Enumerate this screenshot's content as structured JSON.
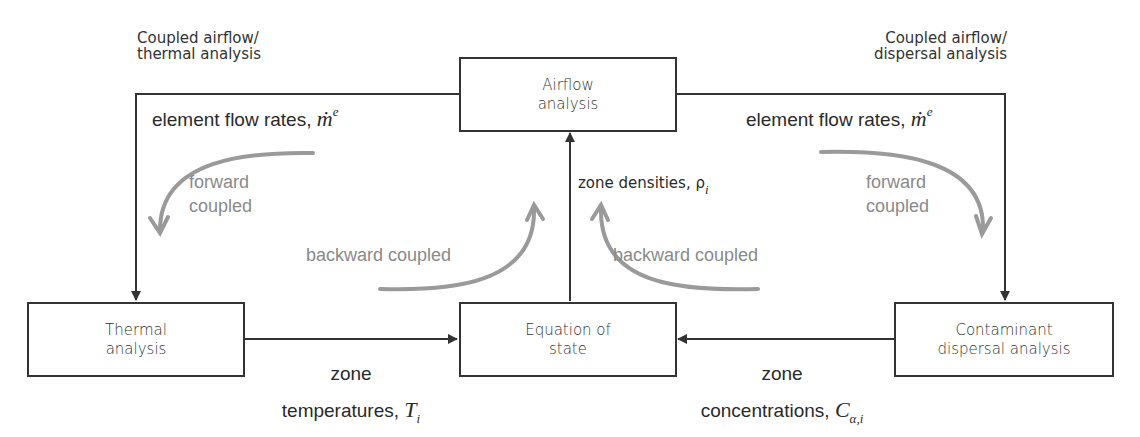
{
  "captions": {
    "left": {
      "line1": "Coupled airflow/",
      "line2": "thermal analysis"
    },
    "right": {
      "line1": "Coupled airflow/",
      "line2": "dispersal analysis"
    }
  },
  "boxes": {
    "airflow": {
      "line1": "Airflow",
      "line2": "analysis"
    },
    "thermal": {
      "line1": "Thermal",
      "line2": "analysis"
    },
    "equation": {
      "line1": "Equation of",
      "line2": "state"
    },
    "contaminant": {
      "line1": "Contaminant",
      "line2": "dispersal analysis"
    }
  },
  "flows": {
    "left_flow_rates": {
      "text": "element flow rates, ",
      "symbol": "ṁ",
      "sup": "e"
    },
    "right_flow_rates": {
      "text": "element flow rates, ",
      "symbol": "ṁ",
      "sup": "e"
    },
    "densities": {
      "text": "zone densities, ",
      "symbol": "ρ",
      "sub": "i"
    },
    "temperatures": {
      "line1": "zone",
      "line2": "temperatures, ",
      "symbol": "T",
      "sub": "i"
    },
    "concentrations": {
      "line1": "zone",
      "line2": "concentrations, ",
      "symbol": "C",
      "sub": "α,i"
    }
  },
  "coupling_labels": {
    "forward_left": {
      "line1": "forward",
      "line2": "coupled"
    },
    "forward_right": {
      "line1": "forward",
      "line2": "coupled"
    },
    "backward_left": "backward coupled",
    "backward_right": "backward coupled"
  },
  "colors": {
    "line": "#333333",
    "coupling_arrow": "#9a9a9a",
    "coupling_text": "#8a8a8a"
  }
}
